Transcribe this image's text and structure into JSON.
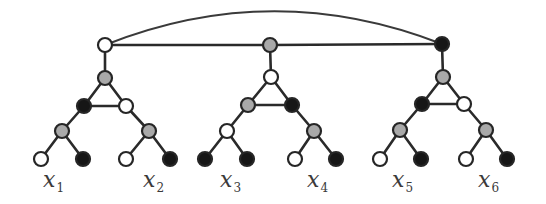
{
  "diagram": {
    "colors": {
      "white": "#ffffff",
      "gray": "#a9a9a9",
      "black": "#161616",
      "stroke": "#262626",
      "background": "#ffffff"
    },
    "node_radius": 7,
    "nodes": [
      {
        "id": "r1",
        "x": 105,
        "y": 45,
        "fill": "white"
      },
      {
        "id": "r2",
        "x": 270,
        "y": 45,
        "fill": "gray"
      },
      {
        "id": "r3",
        "x": 442,
        "y": 44,
        "fill": "black"
      },
      {
        "id": "a1",
        "x": 105,
        "y": 78,
        "fill": "gray"
      },
      {
        "id": "a1l",
        "x": 84,
        "y": 106,
        "fill": "black"
      },
      {
        "id": "a1r",
        "x": 126,
        "y": 106,
        "fill": "white"
      },
      {
        "id": "a1ll",
        "x": 62,
        "y": 131,
        "fill": "gray"
      },
      {
        "id": "a1rr",
        "x": 149,
        "y": 131,
        "fill": "gray"
      },
      {
        "id": "L1",
        "x": 41,
        "y": 159,
        "fill": "white"
      },
      {
        "id": "L2",
        "x": 83,
        "y": 159,
        "fill": "black"
      },
      {
        "id": "L3",
        "x": 126,
        "y": 159,
        "fill": "white"
      },
      {
        "id": "L4",
        "x": 170,
        "y": 159,
        "fill": "black"
      },
      {
        "id": "a2",
        "x": 271,
        "y": 77,
        "fill": "white"
      },
      {
        "id": "a2l",
        "x": 248,
        "y": 105,
        "fill": "gray"
      },
      {
        "id": "a2r",
        "x": 292,
        "y": 105,
        "fill": "black"
      },
      {
        "id": "a2ll",
        "x": 227,
        "y": 131,
        "fill": "white"
      },
      {
        "id": "a2rr",
        "x": 314,
        "y": 131,
        "fill": "gray"
      },
      {
        "id": "L5",
        "x": 205,
        "y": 159,
        "fill": "black"
      },
      {
        "id": "L6",
        "x": 247,
        "y": 159,
        "fill": "black"
      },
      {
        "id": "L7",
        "x": 295,
        "y": 159,
        "fill": "white"
      },
      {
        "id": "L8",
        "x": 336,
        "y": 159,
        "fill": "black"
      },
      {
        "id": "a3",
        "x": 443,
        "y": 77,
        "fill": "gray"
      },
      {
        "id": "a3l",
        "x": 422,
        "y": 104,
        "fill": "black"
      },
      {
        "id": "a3r",
        "x": 464,
        "y": 104,
        "fill": "white"
      },
      {
        "id": "a3ll",
        "x": 400,
        "y": 130,
        "fill": "gray"
      },
      {
        "id": "a3rr",
        "x": 486,
        "y": 130,
        "fill": "gray"
      },
      {
        "id": "L9",
        "x": 380,
        "y": 159,
        "fill": "white"
      },
      {
        "id": "L10",
        "x": 421,
        "y": 159,
        "fill": "black"
      },
      {
        "id": "L11",
        "x": 466,
        "y": 159,
        "fill": "white"
      },
      {
        "id": "L12",
        "x": 507,
        "y": 159,
        "fill": "black"
      }
    ],
    "edges": [
      [
        "r1",
        "r2"
      ],
      [
        "r2",
        "r3"
      ],
      [
        "r1",
        "a1"
      ],
      [
        "a1",
        "a1l"
      ],
      [
        "a1",
        "a1r"
      ],
      [
        "a1l",
        "a1r"
      ],
      [
        "a1l",
        "a1ll"
      ],
      [
        "a1r",
        "a1rr"
      ],
      [
        "a1ll",
        "L1"
      ],
      [
        "a1ll",
        "L2"
      ],
      [
        "a1rr",
        "L3"
      ],
      [
        "a1rr",
        "L4"
      ],
      [
        "r2",
        "a2"
      ],
      [
        "a2",
        "a2l"
      ],
      [
        "a2",
        "a2r"
      ],
      [
        "a2l",
        "a2r"
      ],
      [
        "a2l",
        "a2ll"
      ],
      [
        "a2r",
        "a2rr"
      ],
      [
        "a2ll",
        "L5"
      ],
      [
        "a2ll",
        "L6"
      ],
      [
        "a2rr",
        "L7"
      ],
      [
        "a2rr",
        "L8"
      ],
      [
        "r3",
        "a3"
      ],
      [
        "a3",
        "a3l"
      ],
      [
        "a3",
        "a3r"
      ],
      [
        "a3l",
        "a3r"
      ],
      [
        "a3l",
        "a3ll"
      ],
      [
        "a3r",
        "a3rr"
      ],
      [
        "a3ll",
        "L9"
      ],
      [
        "a3ll",
        "L10"
      ],
      [
        "a3rr",
        "L11"
      ],
      [
        "a3rr",
        "L12"
      ]
    ],
    "arc": {
      "from": "r1",
      "to": "r3",
      "control_x": 273,
      "control_y": -22
    },
    "labels": [
      {
        "var": "x",
        "sub": "1",
        "x": 43,
        "y": 187
      },
      {
        "var": "x",
        "sub": "2",
        "x": 143,
        "y": 187
      },
      {
        "var": "x",
        "sub": "3",
        "x": 220,
        "y": 187
      },
      {
        "var": "x",
        "sub": "4",
        "x": 307,
        "y": 187
      },
      {
        "var": "x",
        "sub": "5",
        "x": 392,
        "y": 187
      },
      {
        "var": "x",
        "sub": "6",
        "x": 478,
        "y": 187
      }
    ]
  }
}
